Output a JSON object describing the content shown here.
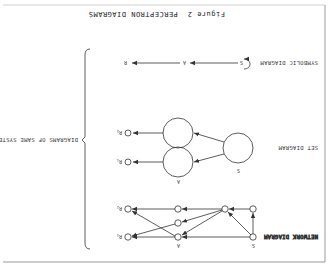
{
  "figure": {
    "title": "Figure 2  PERCEPTRON DIAGRAMS",
    "orientation": "rotated 180 degrees",
    "bracket_label": "DIAGRAMS OF SAME SYSTEM"
  },
  "rows": [
    {
      "label": "SYMBOLIC DIAGRAM",
      "nodes": [
        "S",
        "A",
        "R"
      ]
    },
    {
      "label": "SET DIAGRAM",
      "nodes": [
        "S",
        "A",
        "R1",
        "R2"
      ]
    },
    {
      "label": "NETWORK DIAGRAM",
      "nodes": [
        "S",
        "A",
        "R1",
        "R2"
      ]
    }
  ],
  "symbolic": {
    "s": "S",
    "a": "A",
    "r": "R"
  },
  "set": {
    "s": "S",
    "a": "A",
    "r1": "R",
    "r1_sub": "1",
    "r2": "R",
    "r2_sub": "2"
  },
  "network": {
    "s": "S",
    "a": "A",
    "r1": "R",
    "r1_sub": "1",
    "r2": "R",
    "r2_sub": "2"
  },
  "colors": {
    "ink": "#333333",
    "frame": "#9a9a9a",
    "background": "#ffffff"
  }
}
